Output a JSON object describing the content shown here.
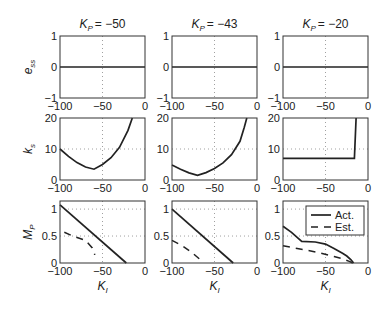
{
  "chart_data": {
    "type": "line",
    "layout": "3x3 grid of subplots; columns by K_P, rows by metric",
    "columns": [
      {
        "title_base": "K",
        "title_sub": "P",
        "title_value": "= −50",
        "kp": -50
      },
      {
        "title_base": "K",
        "title_sub": "P",
        "title_value": "= −43",
        "kp": -43
      },
      {
        "title_base": "K",
        "title_sub": "P",
        "title_value": "= −20",
        "kp": -20
      }
    ],
    "rows": [
      {
        "ylabel_base": "e",
        "ylabel_sub": "ss",
        "ylim": [
          -1,
          1
        ],
        "yticks": [
          "1",
          "0",
          "−1"
        ],
        "ytick_values": [
          1,
          0,
          -1
        ],
        "grid_y": []
      },
      {
        "ylabel_base": "k",
        "ylabel_sub": "s",
        "ylim": [
          0,
          20
        ],
        "yticks": [
          "20",
          "10",
          "0"
        ],
        "ytick_values": [
          20,
          10,
          0
        ],
        "grid_y": [
          10
        ]
      },
      {
        "ylabel_base": "M",
        "ylabel_sub": "P",
        "ylim": [
          0,
          1.15
        ],
        "yticks": [
          "1",
          "0.5",
          "0"
        ],
        "ytick_values": [
          1,
          0.5,
          0
        ],
        "grid_y": [
          1,
          0.5
        ]
      }
    ],
    "xlim": [
      -100,
      0
    ],
    "xticks": [
      "−100",
      "−50",
      "0"
    ],
    "xtick_values": [
      -100,
      -50,
      0
    ],
    "grid_x": [
      -50
    ],
    "xlabel_base": "K",
    "xlabel_sub": "I",
    "legend": {
      "location": "upper right of bottom-right subplot",
      "entries": [
        {
          "label": "Act.",
          "style": "solid"
        },
        {
          "label": "Est.",
          "style": "dashed"
        }
      ]
    },
    "series": {
      "ess": [
        {
          "name": "Act.",
          "panel": [
            0,
            0
          ],
          "x": [
            -100,
            0
          ],
          "y": [
            0,
            0
          ]
        },
        {
          "name": "Act.",
          "panel": [
            0,
            1
          ],
          "x": [
            -100,
            0
          ],
          "y": [
            0,
            0
          ]
        },
        {
          "name": "Act.",
          "panel": [
            0,
            2
          ],
          "x": [
            -100,
            0
          ],
          "y": [
            0,
            0
          ]
        }
      ],
      "ks": [
        {
          "name": "Act.",
          "panel": [
            1,
            0
          ],
          "x": [
            -100,
            -90,
            -80,
            -70,
            -60,
            -50,
            -40,
            -30,
            -20,
            -15
          ],
          "y": [
            10,
            7.6,
            5.6,
            4.2,
            3.5,
            5.0,
            7.2,
            10.5,
            16,
            20
          ]
        },
        {
          "name": "Act.",
          "panel": [
            1,
            1
          ],
          "x": [
            -100,
            -90,
            -80,
            -70,
            -60,
            -50,
            -40,
            -30,
            -20,
            -15,
            -12
          ],
          "y": [
            4.8,
            3.5,
            2.3,
            1.5,
            2.4,
            3.7,
            5.5,
            8.2,
            12.5,
            17,
            20
          ]
        },
        {
          "name": "Act.",
          "panel": [
            1,
            2
          ],
          "x": [
            -100,
            -20,
            -16,
            -14
          ],
          "y": [
            7,
            7,
            7,
            20
          ]
        }
      ],
      "mp": [
        {
          "name": "Act.",
          "panel": [
            2,
            0
          ],
          "x": [
            -100,
            -22
          ],
          "y": [
            1.08,
            0
          ]
        },
        {
          "name": "Est.",
          "panel": [
            2,
            0
          ],
          "x": [
            -95,
            -85,
            -70,
            -62,
            -60,
            -59
          ],
          "y": [
            0.57,
            0.5,
            0.42,
            0.28,
            0.2,
            0.15
          ]
        },
        {
          "name": "Act.",
          "panel": [
            2,
            1
          ],
          "x": [
            -100,
            -28
          ],
          "y": [
            1.0,
            0
          ]
        },
        {
          "name": "Est.",
          "panel": [
            2,
            1
          ],
          "x": [
            -100,
            -88,
            -77,
            -68,
            -66,
            -65
          ],
          "y": [
            0.42,
            0.32,
            0.2,
            0.08,
            0.05,
            0
          ]
        },
        {
          "name": "Act.",
          "panel": [
            2,
            2
          ],
          "x": [
            -100,
            -90,
            -78,
            -62,
            -50,
            -40,
            -30,
            -25,
            -20,
            -17
          ],
          "y": [
            0.68,
            0.57,
            0.4,
            0.39,
            0.35,
            0.27,
            0.18,
            0.13,
            0.06,
            0
          ]
        },
        {
          "name": "Est.",
          "panel": [
            2,
            2
          ],
          "x": [
            -100,
            -80,
            -60,
            -40,
            -30,
            -22,
            -18
          ],
          "y": [
            0.32,
            0.26,
            0.2,
            0.12,
            0.08,
            0.03,
            0
          ]
        }
      ]
    }
  }
}
